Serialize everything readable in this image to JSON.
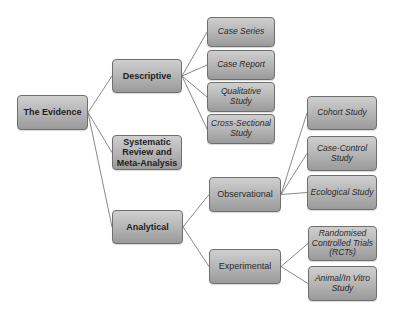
{
  "diagram": {
    "type": "hierarchy-tree",
    "root": "The Evidence",
    "nodes": {
      "root": "The Evidence",
      "descriptive": "Descriptive",
      "systematic": [
        "Systematic",
        "Review and",
        "Meta-Analysis"
      ],
      "analytical": "Analytical",
      "observational": "Observational",
      "experimental": "Experimental",
      "case_series": "Case Series",
      "case_report": "Case Report",
      "qualitative": [
        "Qualitative",
        "Study"
      ],
      "cross_sectional": [
        "Cross-Sectional",
        "Study"
      ],
      "cohort": "Cohort Study",
      "case_control": [
        "Case-Control",
        "Study"
      ],
      "ecological": "Ecological Study",
      "rct": [
        "Randomised",
        "Controlled Trials",
        "(RCTs)"
      ],
      "animal": [
        "Animal/In Vitro",
        "Study"
      ]
    },
    "edges": [
      [
        "root",
        "descriptive"
      ],
      [
        "root",
        "systematic"
      ],
      [
        "root",
        "analytical"
      ],
      [
        "descriptive",
        "case_series"
      ],
      [
        "descriptive",
        "case_report"
      ],
      [
        "descriptive",
        "qualitative"
      ],
      [
        "descriptive",
        "cross_sectional"
      ],
      [
        "analytical",
        "observational"
      ],
      [
        "analytical",
        "experimental"
      ],
      [
        "observational",
        "cohort"
      ],
      [
        "observational",
        "case_control"
      ],
      [
        "observational",
        "ecological"
      ],
      [
        "experimental",
        "rct"
      ],
      [
        "experimental",
        "animal"
      ]
    ],
    "colors": {
      "node_fill_top": "#cfcfcf",
      "node_fill_bottom": "#9a9a9a",
      "node_border": "#6f6f6f",
      "line": "#6a6a6a",
      "text": "#1e1e1e"
    }
  }
}
